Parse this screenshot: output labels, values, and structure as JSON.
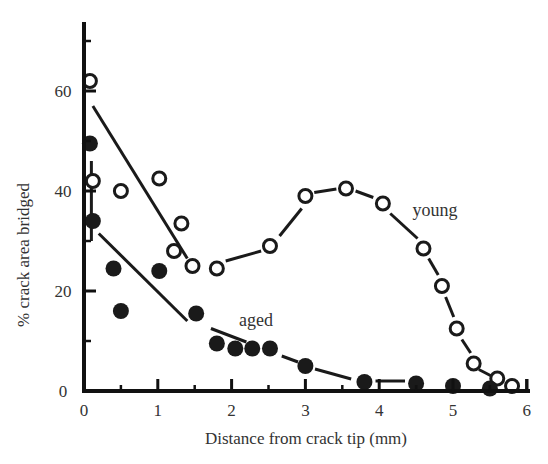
{
  "chart_data": {
    "type": "scatter",
    "title": "",
    "xlabel": "Distance from crack tip (mm)",
    "ylabel": "% crack area bridged",
    "xlim": [
      0,
      6
    ],
    "ylim": [
      0,
      74
    ],
    "xticks": [
      0,
      1,
      2,
      3,
      4,
      5,
      6
    ],
    "xticks_minor": [
      0.5,
      1.5,
      2.5,
      3.5,
      4.5,
      5.5
    ],
    "yticks": [
      0,
      20,
      40,
      60
    ],
    "yticks_minor": [
      10,
      30,
      50,
      70
    ],
    "grid": false,
    "legend": "inline labels",
    "series": [
      {
        "name": "young",
        "marker": "open-circle",
        "label_position": {
          "x": 4.45,
          "y": 35
        },
        "points": [
          {
            "x": 0.08,
            "y": 62
          },
          {
            "x": 0.12,
            "y": 42
          },
          {
            "x": 0.5,
            "y": 40
          },
          {
            "x": 1.02,
            "y": 42.5
          },
          {
            "x": 1.32,
            "y": 33.5
          },
          {
            "x": 1.22,
            "y": 28
          },
          {
            "x": 1.47,
            "y": 25
          },
          {
            "x": 1.8,
            "y": 24.5
          },
          {
            "x": 2.52,
            "y": 29
          },
          {
            "x": 3.0,
            "y": 39
          },
          {
            "x": 3.55,
            "y": 40.5
          },
          {
            "x": 4.05,
            "y": 37.5
          },
          {
            "x": 4.6,
            "y": 28.5
          },
          {
            "x": 4.85,
            "y": 21
          },
          {
            "x": 5.05,
            "y": 12.5
          },
          {
            "x": 5.28,
            "y": 5.5
          },
          {
            "x": 5.6,
            "y": 2.5
          },
          {
            "x": 5.8,
            "y": 1
          }
        ],
        "fit_segments": [
          {
            "x1": 0.12,
            "y1": 57,
            "x2": 1.4,
            "y2": 26.5
          },
          {
            "x1": 1.92,
            "y1": 26,
            "x2": 2.4,
            "y2": 28
          },
          {
            "x1": 2.65,
            "y1": 31,
            "x2": 2.95,
            "y2": 36.5
          },
          {
            "x1": 3.12,
            "y1": 39.7,
            "x2": 3.42,
            "y2": 40.4
          },
          {
            "x1": 3.68,
            "y1": 40,
            "x2": 3.92,
            "y2": 38.7
          },
          {
            "x1": 4.15,
            "y1": 35.5,
            "x2": 4.52,
            "y2": 30.5
          },
          {
            "x1": 4.67,
            "y1": 26.5,
            "x2": 4.8,
            "y2": 23.2
          },
          {
            "x1": 4.9,
            "y1": 18.8,
            "x2": 5.01,
            "y2": 14.8
          },
          {
            "x1": 5.12,
            "y1": 10.3,
            "x2": 5.24,
            "y2": 7.6
          },
          {
            "x1": 5.35,
            "y1": 4.3,
            "x2": 5.52,
            "y2": 3
          }
        ]
      },
      {
        "name": "aged",
        "marker": "filled-circle",
        "label_position": {
          "x": 2.1,
          "y": 13
        },
        "points": [
          {
            "x": 0.08,
            "y": 49.5
          },
          {
            "x": 0.12,
            "y": 34
          },
          {
            "x": 0.4,
            "y": 24.5
          },
          {
            "x": 0.5,
            "y": 16
          },
          {
            "x": 1.02,
            "y": 24
          },
          {
            "x": 1.52,
            "y": 15.5
          },
          {
            "x": 1.8,
            "y": 9.5
          },
          {
            "x": 2.05,
            "y": 8.5
          },
          {
            "x": 2.28,
            "y": 8.5
          },
          {
            "x": 2.52,
            "y": 8.5
          },
          {
            "x": 3.0,
            "y": 5
          },
          {
            "x": 3.8,
            "y": 1.8
          },
          {
            "x": 4.5,
            "y": 1.5
          },
          {
            "x": 5.0,
            "y": 1
          },
          {
            "x": 5.5,
            "y": 0.5
          }
        ],
        "fit_segments": [
          {
            "x1": 0.2,
            "y1": 31.5,
            "x2": 1.4,
            "y2": 14
          },
          {
            "x1": 1.72,
            "y1": 12.5,
            "x2": 2.2,
            "y2": 9.8
          },
          {
            "x1": 2.68,
            "y1": 7,
            "x2": 2.9,
            "y2": 5.8
          },
          {
            "x1": 3.13,
            "y1": 4.4,
            "x2": 3.62,
            "y2": 2.4
          },
          {
            "x1": 3.95,
            "y1": 2,
            "x2": 4.35,
            "y2": 2
          }
        ]
      }
    ],
    "error_bars": [
      {
        "x": 0.1,
        "y_low": 30,
        "y_high": 46
      }
    ]
  }
}
